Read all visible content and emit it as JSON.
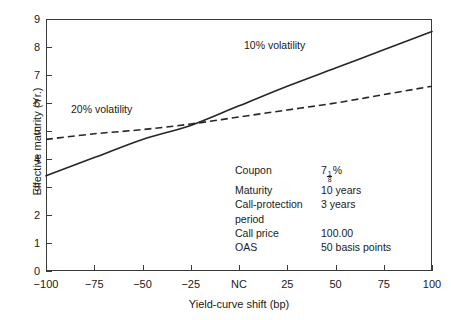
{
  "chart_data": {
    "type": "line",
    "title": "",
    "xlabel": "Yield-curve shift (bp)",
    "ylabel": "Effective maturity (Yr.)",
    "xlim": [
      -100,
      100
    ],
    "ylim": [
      0,
      9
    ],
    "grid": false,
    "legend_position": "inline-annotation",
    "x_tick_values": [
      -100,
      -75,
      -50,
      -25,
      0,
      25,
      50,
      75,
      100
    ],
    "x_tick_labels": [
      "−100",
      "−75",
      "−50",
      "−25",
      "NC",
      "25",
      "50",
      "75",
      "100"
    ],
    "y_tick_values": [
      0,
      1,
      2,
      3,
      4,
      5,
      6,
      7,
      8,
      9
    ],
    "y_tick_labels": [
      "0",
      "1",
      "2",
      "3",
      "4",
      "5",
      "6",
      "7",
      "8",
      "9"
    ],
    "x": [
      -100,
      -75,
      -50,
      -25,
      0,
      25,
      50,
      75,
      100
    ],
    "series": [
      {
        "name": "10% volatility",
        "style": "solid",
        "color": "#262626",
        "values": [
          3.4,
          4.05,
          4.7,
          5.2,
          5.9,
          6.6,
          7.25,
          7.9,
          8.55
        ]
      },
      {
        "name": "20% volatility",
        "style": "dashed",
        "color": "#262626",
        "values": [
          4.7,
          4.9,
          5.05,
          5.25,
          5.5,
          5.75,
          6.0,
          6.3,
          6.6
        ]
      }
    ],
    "annotations": [
      {
        "text": "10% volatility",
        "series": "10% volatility"
      },
      {
        "text": "20% volatility",
        "series": "20% volatility"
      }
    ]
  },
  "parameters": {
    "rows": [
      {
        "label": "Coupon",
        "value": "7",
        "value_fraction_num": "1",
        "value_fraction_den": "8",
        "value_suffix": "%"
      },
      {
        "label": "Maturity",
        "value": "10 years"
      },
      {
        "label": "Call-protection",
        "value": "3 years"
      },
      {
        "label": "period",
        "value": ""
      },
      {
        "label": "Call price",
        "value": "100.00"
      },
      {
        "label": "OAS",
        "value": "50 basis points"
      }
    ]
  }
}
